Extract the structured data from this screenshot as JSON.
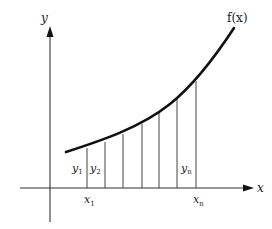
{
  "diagram": {
    "axes": {
      "x_label": "x",
      "y_label": "y"
    },
    "curve_label": "f(x)",
    "ordinate_labels": {
      "first": "y",
      "first_sub": "1",
      "second": "y",
      "second_sub": "2",
      "last": "y",
      "last_sub": "n"
    },
    "abscissa_labels": {
      "first": "x",
      "first_sub": "1",
      "last": "x",
      "last_sub": "n"
    },
    "strip_count_visible": 7,
    "colors": {
      "curve": "#111111",
      "axes": "#333333",
      "strips": "#444444"
    }
  }
}
